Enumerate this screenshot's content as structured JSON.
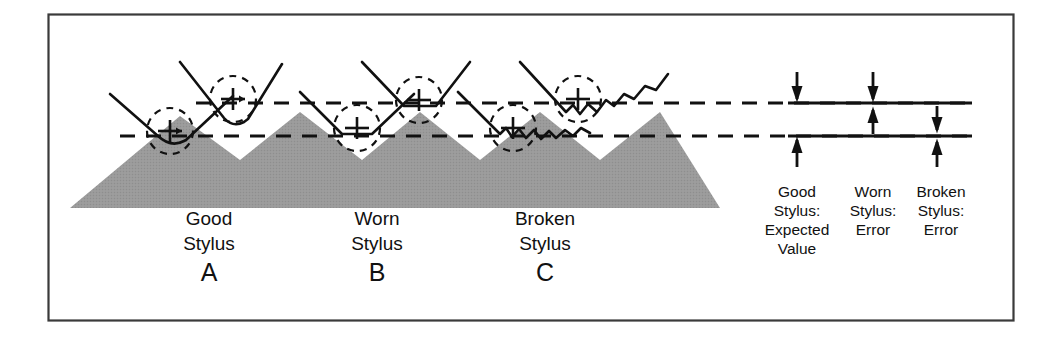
{
  "figure": {
    "frame": {
      "border_color": "#3a3a3a",
      "background": "#ffffff"
    },
    "colors": {
      "surface_gray": "#989898",
      "line_black": "#111111",
      "frame": "#3a3a3a"
    }
  },
  "surface": {
    "name": "sawtooth-workpiece-surface",
    "description": "Gray hatched triangular workpiece with sawtooth peaks"
  },
  "reference_lines": {
    "upper": {
      "name": "upper-reference-line",
      "style": "dashed"
    },
    "lower": {
      "name": "lower-reference-line",
      "style": "dashed"
    }
  },
  "styli": [
    {
      "id": "A",
      "name": "good-stylus",
      "condition": "Good",
      "label_line1": "Good",
      "label_line2": "Stylus",
      "letter": "A",
      "tip_state": "sharp"
    },
    {
      "id": "B",
      "name": "worn-stylus",
      "condition": "Worn",
      "label_line1": "Worn",
      "label_line2": "Stylus",
      "letter": "B",
      "tip_state": "rounded-worn"
    },
    {
      "id": "C",
      "name": "broken-stylus",
      "condition": "Broken",
      "label_line1": "Broken",
      "label_line2": "Stylus",
      "letter": "C",
      "tip_state": "chipped-jagged"
    }
  ],
  "measurement": {
    "lines": {
      "top": {
        "name": "measurement-line-top"
      },
      "bottom": {
        "name": "measurement-line-bottom"
      }
    },
    "columns": [
      {
        "id": "good",
        "name": "good-stylus-measurement",
        "line1": "Good",
        "line2": "Stylus:",
        "line3": "Expected",
        "line4": "Value",
        "arrows": "full-span-inward"
      },
      {
        "id": "worn",
        "name": "worn-stylus-measurement",
        "line1": "Worn",
        "line2": "Stylus:",
        "line3": "Error",
        "line4": "",
        "arrows": "top-line-converging"
      },
      {
        "id": "broken",
        "name": "broken-stylus-measurement",
        "line1": "Broken",
        "line2": "Stylus:",
        "line3": "Error",
        "line4": "",
        "arrows": "bottom-line-converging"
      }
    ]
  }
}
